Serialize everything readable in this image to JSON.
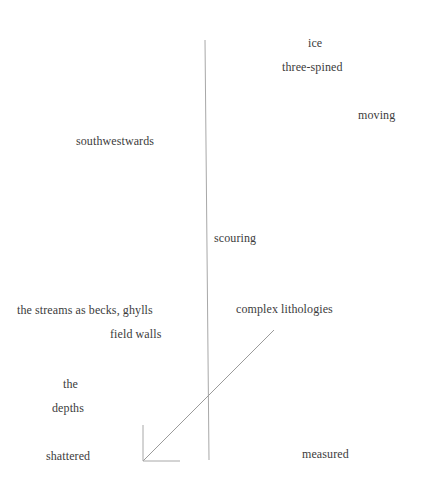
{
  "poem": {
    "words": [
      {
        "id": "ice",
        "text": "ice"
      },
      {
        "id": "three-spined",
        "text": "three-spined"
      },
      {
        "id": "moving",
        "text": "moving"
      },
      {
        "id": "southwestwards",
        "text": "southwestwards"
      },
      {
        "id": "scouring",
        "text": "scouring"
      },
      {
        "id": "streams",
        "text": "the streams as becks, ghylls"
      },
      {
        "id": "complex",
        "text": "complex lithologies"
      },
      {
        "id": "field-walls",
        "text": "field walls"
      },
      {
        "id": "the",
        "text": "the"
      },
      {
        "id": "depths",
        "text": "depths"
      },
      {
        "id": "shattered",
        "text": "shattered"
      },
      {
        "id": "measured",
        "text": "measured"
      }
    ]
  },
  "colors": {
    "text": "#3c3c3c",
    "line": "#9a9a9a"
  }
}
